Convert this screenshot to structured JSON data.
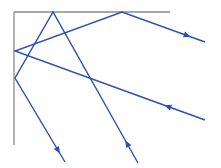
{
  "title": "Corner reflector: light rays reflecting off two perpendicular mirrors",
  "colors": {
    "background": "#ffffff",
    "mirror": "#8a8a8a",
    "ray": "#2b4fb8"
  },
  "mirrors": [
    {
      "id": "vertical-mirror",
      "x1": 14,
      "y1": 12,
      "x2": 14,
      "y2": 145
    },
    {
      "id": "horizontal-mirror",
      "x1": 14,
      "y1": 12,
      "x2": 170,
      "y2": 12
    }
  ],
  "rays": [
    {
      "id": "ray-1",
      "description": "Enters from lower right, reflects off vertical mirror then top mirror, exits to the right",
      "points": [
        [
          205,
          120
        ],
        [
          15,
          51
        ],
        [
          122,
          12
        ],
        [
          205,
          42
        ]
      ],
      "arrows": [
        {
          "at": [
            168,
            107
          ],
          "direction": "left"
        },
        {
          "at": [
            187,
            35
          ],
          "direction": "right"
        }
      ]
    },
    {
      "id": "ray-2",
      "description": "Enters from bottom, reflects off top mirror then vertical mirror, exits downward",
      "points": [
        [
          138,
          163
        ],
        [
          53,
          12
        ],
        [
          15,
          78
        ],
        [
          65,
          162
        ]
      ],
      "arrows": [
        {
          "at": [
            129,
            143
          ],
          "direction": "up"
        },
        {
          "at": [
            58,
            150
          ],
          "direction": "down"
        }
      ]
    }
  ]
}
